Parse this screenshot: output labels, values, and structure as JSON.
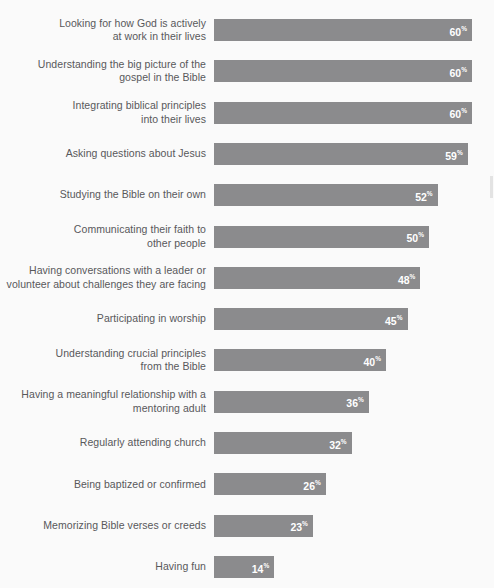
{
  "chart_data": {
    "type": "bar",
    "orientation": "horizontal",
    "title": "",
    "subtitle": "",
    "xlabel": "",
    "ylabel": "",
    "xlim": [
      0,
      60
    ],
    "grid": false,
    "legend": null,
    "value_suffix": "%",
    "categories": [
      "Looking for how God is actively\nat work in their lives",
      "Understanding the big picture of the\ngospel in the Bible",
      "Integrating biblical principles\ninto their lives",
      "Asking questions about Jesus",
      "Studying the Bible on their own",
      "Communicating their faith to\nother people",
      "Having conversations with a leader or\nvolunteer about challenges they are facing",
      "Participating in worship",
      "Understanding crucial principles\nfrom the Bible",
      "Having a meaningful relationship with a\nmentoring adult",
      "Regularly attending church",
      "Being baptized or confirmed",
      "Memorizing Bible verses or creeds",
      "Having fun"
    ],
    "values": [
      60,
      60,
      60,
      59,
      52,
      50,
      48,
      45,
      40,
      36,
      32,
      26,
      23,
      14
    ],
    "value_labels": [
      "60",
      "60",
      "60",
      "59",
      "52",
      "50",
      "48",
      "45",
      "40",
      "36",
      "32",
      "26",
      "23",
      "14"
    ],
    "colors": {
      "bar": "#8b8b8d",
      "background": "#fafafa",
      "label_text": "#58585a",
      "value_text": "#ffffff"
    }
  }
}
